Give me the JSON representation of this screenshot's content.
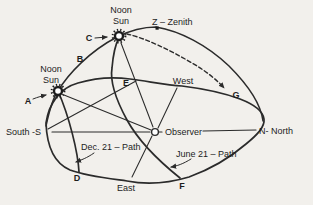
{
  "colors": {
    "background": "#f2f0ec",
    "ink": "#2b2b2b",
    "text": "#1d1d1d"
  },
  "diagram": {
    "type": "sun-path-celestial-dome-diagram",
    "suns": {
      "june_noon": {
        "line1": "Noon",
        "line2": "Sun"
      },
      "dec_noon": {
        "line1": "Noon",
        "line2": "Sun"
      }
    },
    "zenith_label": "Z – Zenith",
    "observer_label": "Observer",
    "horizon_labels": {
      "south": "South -S",
      "north": "N- North",
      "east": "East",
      "west": "West"
    },
    "path_labels": {
      "dec": "Dec. 21 – Path",
      "june": "June 21 – Path"
    },
    "points": {
      "a": "A",
      "b": "B",
      "c": "C",
      "d": "D",
      "e": "E",
      "f": "F",
      "g": "G"
    }
  }
}
